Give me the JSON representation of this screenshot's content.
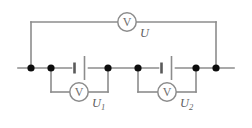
{
  "diagram": {
    "type": "electrical-circuit-schematic",
    "background_color": "#ffffff",
    "wire_color": "#8c8c8c",
    "node_color": "#0d0d0d",
    "label_color": "#5f5f5f"
  },
  "meters": {
    "total": {
      "glyph": "V",
      "label": "U",
      "subscript": "",
      "role": "total-voltage-voltmeter"
    },
    "first": {
      "glyph": "V",
      "label": "U",
      "subscript": "1",
      "role": "cell-one-voltmeter"
    },
    "second": {
      "glyph": "V",
      "label": "U",
      "subscript": "2",
      "role": "cell-two-voltmeter"
    }
  },
  "components": {
    "cell_one": {
      "name": "battery-cell",
      "symbol": "single-cell"
    },
    "cell_two": {
      "name": "battery-cell",
      "symbol": "single-cell"
    }
  },
  "nodes": {
    "count": 6,
    "x_positions": [
      31,
      51,
      108,
      138,
      196,
      216
    ],
    "y_position": 68
  },
  "geometry": {
    "main_wire_y": 68,
    "main_wire_x_start": 18,
    "main_wire_x_end": 234,
    "top_wire_y": 22,
    "branch_wire_y": 92,
    "meter_radius": 9.2,
    "total_meter_x": 127,
    "first_meter_x": 79,
    "second_meter_x": 167,
    "cell_one_x": 80,
    "cell_two_x": 167
  }
}
